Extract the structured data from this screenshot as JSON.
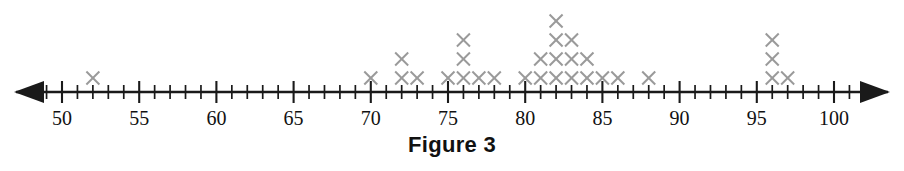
{
  "figure": {
    "caption": "Figure 3",
    "axis": {
      "left_arrow": "left-arrow",
      "right_arrow": "right-arrow",
      "axis_min": 47,
      "axis_max": 102,
      "tick_step": 1,
      "major_tick_step": 5,
      "labels": [
        "50",
        "55",
        "60",
        "65",
        "70",
        "75",
        "80",
        "85",
        "90",
        "95",
        "100"
      ],
      "label_values": [
        50,
        55,
        60,
        65,
        70,
        75,
        80,
        85,
        90,
        95,
        100
      ],
      "marker_glyph": "x",
      "marker_color": "#9a9a9a",
      "axis_color": "#1a1a1a"
    }
  },
  "chart_data": {
    "type": "bar",
    "plot_style": "dot-plot",
    "title": "Figure 3",
    "xlabel": "",
    "ylabel": "",
    "xlim": [
      47,
      102
    ],
    "ylim": [
      0,
      5
    ],
    "grid": false,
    "legend": "none",
    "marker": "x",
    "categories": [
      50,
      51,
      52,
      53,
      54,
      55,
      56,
      57,
      58,
      59,
      60,
      61,
      62,
      63,
      64,
      65,
      66,
      67,
      68,
      69,
      70,
      71,
      72,
      73,
      74,
      75,
      76,
      77,
      78,
      79,
      80,
      81,
      82,
      83,
      84,
      85,
      86,
      87,
      88,
      89,
      90,
      91,
      92,
      93,
      94,
      95,
      96,
      97,
      98,
      99,
      100
    ],
    "values": [
      0,
      0,
      1,
      0,
      0,
      0,
      0,
      0,
      0,
      0,
      0,
      0,
      0,
      0,
      0,
      0,
      0,
      0,
      0,
      0,
      1,
      0,
      2,
      1,
      0,
      1,
      3,
      1,
      1,
      0,
      1,
      2,
      4,
      3,
      2,
      1,
      1,
      0,
      1,
      0,
      0,
      0,
      0,
      0,
      0,
      0,
      3,
      1,
      0,
      0,
      0
    ],
    "total_count": 30,
    "note": "Each X represents one observation; stacks are counts at that value."
  }
}
